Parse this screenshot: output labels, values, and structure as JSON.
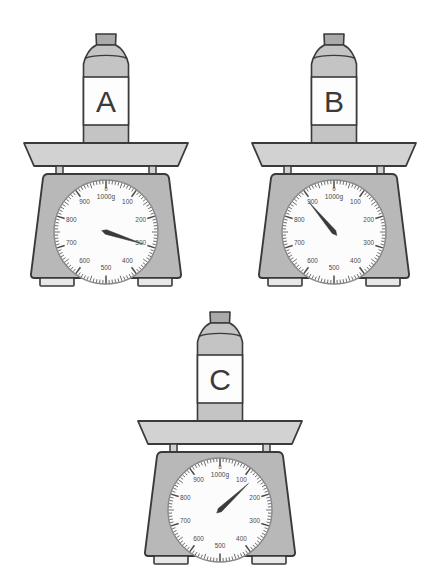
{
  "figure": {
    "background_color": "#ffffff"
  },
  "palette": {
    "outline": "#3a3a3a",
    "body_fill": "#b8b8b8",
    "tray_fill": "#d2d2d2",
    "foot_fill": "#e8e8e8",
    "dial_face": "#fcfcfc",
    "dial_ring": "#8a8a8a",
    "tick": "#4a4a4a",
    "needle": "#3a3a3a",
    "bottle_body": "#c4c4c4",
    "bottle_label": "#fdfdfd",
    "bottle_cap": "#aaaaaa",
    "text": "#4a4a4a"
  },
  "dial": {
    "unit_label": "1000g",
    "zero_label": "0",
    "tick_labels": [
      "100",
      "200",
      "300",
      "400",
      "500",
      "600",
      "700",
      "800",
      "900"
    ],
    "major_values": [
      100,
      200,
      300,
      400,
      500,
      600,
      700,
      800,
      900
    ],
    "min": 0,
    "max": 1000,
    "minor_tick_step": 10,
    "major_tick_step": 100
  },
  "scales": [
    {
      "id": "scale-a",
      "bottle_label": "A",
      "reading_g": 300,
      "needle_angle_deg": 108,
      "position": {
        "left": 18,
        "top": 12
      }
    },
    {
      "id": "scale-b",
      "bottle_label": "B",
      "reading_g": 890,
      "needle_angle_deg": 320,
      "position": {
        "left": 246,
        "top": 12
      }
    },
    {
      "id": "scale-c",
      "bottle_label": "C",
      "reading_g": 130,
      "needle_angle_deg": 47,
      "position": {
        "left": 132,
        "top": 290
      }
    }
  ],
  "chart_data": {
    "type": "table",
    "categories": [
      "A",
      "B",
      "C"
    ],
    "values": [
      300,
      890,
      130
    ],
    "xlabel": "Bottle",
    "ylabel": "Mass (g)",
    "ylim": [
      0,
      1000
    ]
  }
}
